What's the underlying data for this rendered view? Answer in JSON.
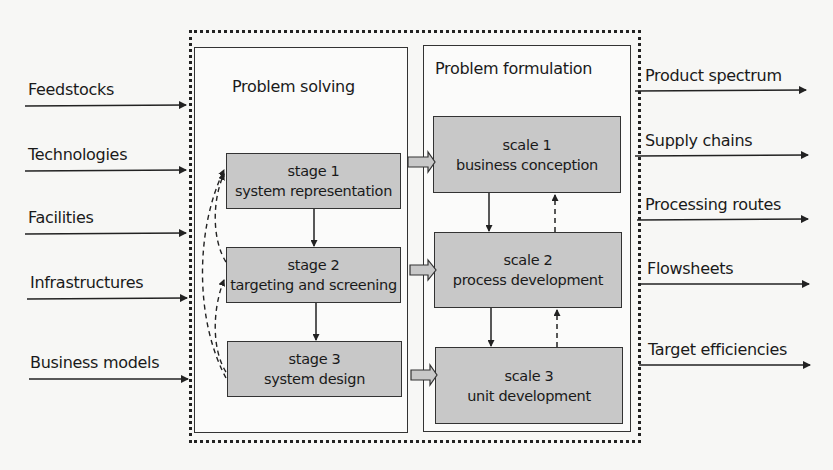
{
  "inputs": [
    {
      "label": "Feedstocks"
    },
    {
      "label": "Technologies"
    },
    {
      "label": "Facilities"
    },
    {
      "label": "Infrastructures"
    },
    {
      "label": "Business models"
    }
  ],
  "outputs": [
    {
      "label": "Product spectrum"
    },
    {
      "label": "Supply chains"
    },
    {
      "label": "Processing routes"
    },
    {
      "label": "Flowsheets"
    },
    {
      "label": "Target efficiencies"
    }
  ],
  "problem_solving": {
    "title": "Problem solving",
    "stages": [
      {
        "line1": "stage 1",
        "line2": "system representation"
      },
      {
        "line1": "stage 2",
        "line2": "targeting and screening"
      },
      {
        "line1": "stage 3",
        "line2": "system design"
      }
    ]
  },
  "problem_formulation": {
    "title": "Problem formulation",
    "scales": [
      {
        "line1": "scale 1",
        "line2": "business conception"
      },
      {
        "line1": "scale 2",
        "line2": "process development"
      },
      {
        "line1": "scale 3",
        "line2": "unit development"
      }
    ]
  },
  "colors": {
    "box_fill": "#c8c8c8",
    "line": "#222222",
    "background": "#f7f7f5"
  }
}
